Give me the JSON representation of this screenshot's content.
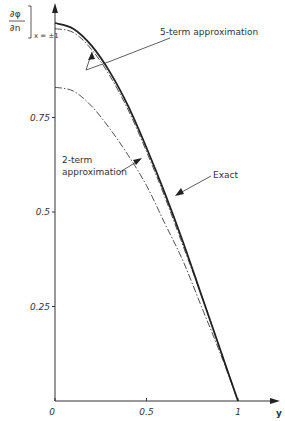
{
  "chart_data": {
    "type": "line",
    "title": "",
    "xlabel": "y",
    "ylabel": "∂φ/∂n ]x=±1",
    "ylabel_parts": {
      "num": "∂φ",
      "den": "∂n",
      "sub": "x = ±1"
    },
    "xlim": [
      0,
      1.05
    ],
    "ylim": [
      0,
      1.0
    ],
    "grid": false,
    "xticks": [
      {
        "value": 0,
        "label": "0"
      },
      {
        "value": 0.5,
        "label": "0.5"
      },
      {
        "value": 1,
        "label": "1"
      }
    ],
    "yticks": [
      {
        "value": 0.25,
        "label": "0.25"
      },
      {
        "value": 0.5,
        "label": "0.5"
      },
      {
        "value": 0.75,
        "label": "0.75"
      }
    ],
    "x": [
      0,
      0.1,
      0.2,
      0.3,
      0.4,
      0.5,
      0.6,
      0.7,
      0.8,
      0.9,
      1.0
    ],
    "series": [
      {
        "name": "Exact",
        "style": "solid-thick",
        "values": [
          1.0,
          0.985,
          0.94,
          0.87,
          0.78,
          0.67,
          0.55,
          0.42,
          0.28,
          0.14,
          0.0
        ]
      },
      {
        "name": "5-term approximation",
        "style": "dash-dot",
        "values": [
          0.985,
          0.975,
          0.93,
          0.86,
          0.77,
          0.66,
          0.54,
          0.41,
          0.28,
          0.14,
          0.0
        ]
      },
      {
        "name": "2-term approximation",
        "style": "dash-dot",
        "values": [
          0.83,
          0.82,
          0.78,
          0.72,
          0.65,
          0.57,
          0.47,
          0.37,
          0.25,
          0.13,
          0.0
        ]
      }
    ],
    "annotations": [
      {
        "text": "5-term approximation",
        "target": "5-term approximation"
      },
      {
        "text": "2-term approximation",
        "text_lines": [
          "2-term",
          "approximation"
        ],
        "target": "2-term approximation"
      },
      {
        "text": "Exact",
        "target": "Exact"
      }
    ]
  }
}
